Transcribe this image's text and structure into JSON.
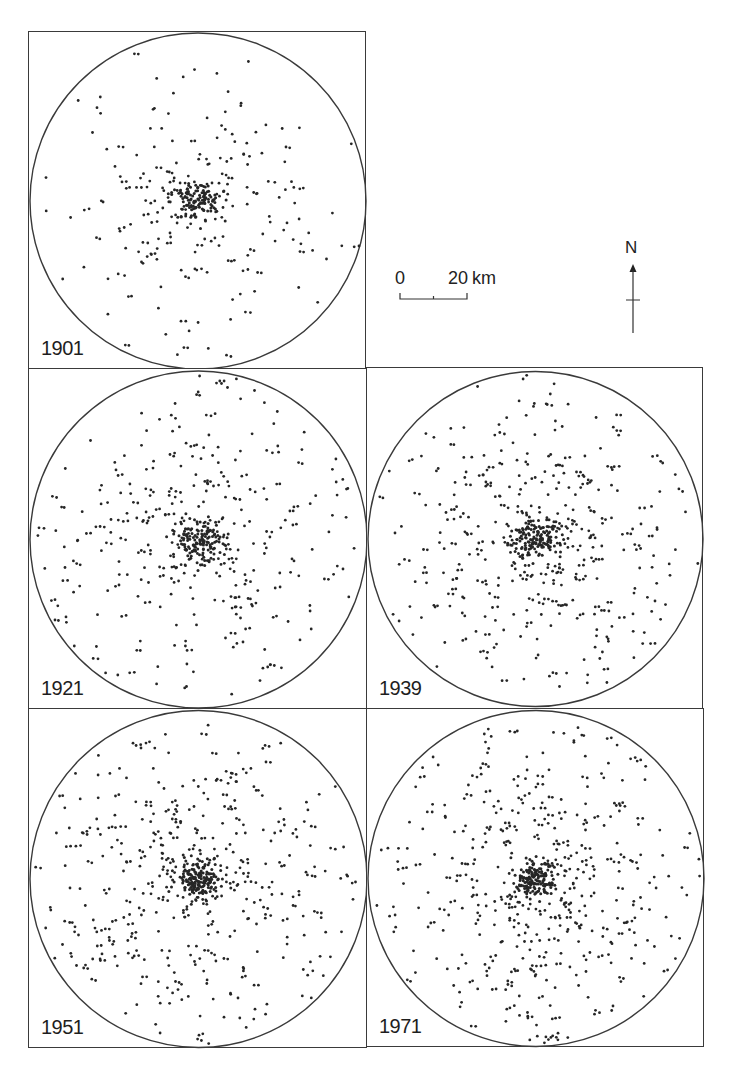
{
  "map": {
    "title": "",
    "line_color": "#3a3a3a",
    "dot_color": "#262626",
    "scale_bar": {
      "start_label": "0",
      "end_label": "20",
      "unit": "km"
    },
    "north_arrow": {
      "label": "N"
    },
    "panels": [
      {
        "id": "p1901",
        "year": "1901",
        "x": 28,
        "y": 31,
        "w": 338,
        "h": 338,
        "dot_count": 330,
        "core_count": 120,
        "spread": 0.33,
        "seed": 11
      },
      {
        "id": "p1921",
        "year": "1921",
        "x": 28,
        "y": 368,
        "w": 339,
        "h": 341,
        "dot_count": 460,
        "core_count": 140,
        "spread": 0.38,
        "seed": 23
      },
      {
        "id": "p1939",
        "year": "1939",
        "x": 366,
        "y": 367,
        "w": 337,
        "h": 342,
        "dot_count": 520,
        "core_count": 150,
        "spread": 0.4,
        "seed": 37
      },
      {
        "id": "p1951",
        "year": "1951",
        "x": 28,
        "y": 708,
        "w": 339,
        "h": 340,
        "dot_count": 580,
        "core_count": 160,
        "spread": 0.41,
        "seed": 53
      },
      {
        "id": "p1971",
        "year": "1971",
        "x": 366,
        "y": 708,
        "w": 338,
        "h": 339,
        "dot_count": 590,
        "core_count": 160,
        "spread": 0.42,
        "seed": 71
      }
    ]
  }
}
